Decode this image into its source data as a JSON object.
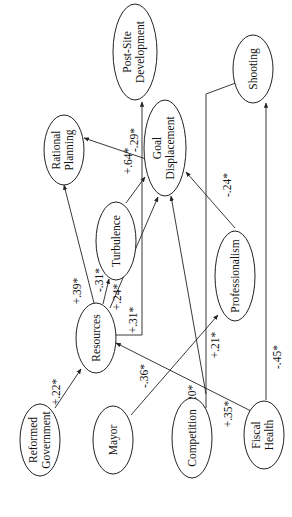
{
  "diagram": {
    "type": "path-diagram",
    "orientation": "rotated-90-ccw",
    "nodes": {
      "reformed_government": {
        "line1": "Reformed",
        "line2": "Government"
      },
      "mayor": {
        "line1": "Mayor"
      },
      "competition": {
        "line1": "Competition"
      },
      "fiscal_health": {
        "line1": "Fiscal",
        "line2": "Health"
      },
      "resources": {
        "line1": "Resources"
      },
      "turbulence": {
        "line1": "Turbulence"
      },
      "professionalism": {
        "line1": "Professionalism"
      },
      "rational_planning": {
        "line1": "Rational",
        "line2": "Planning"
      },
      "goal_displacement": {
        "line1": "Goal",
        "line2": "Displacement"
      },
      "post_site_development": {
        "line1": "Post-Site",
        "line2": "Development"
      },
      "shooting": {
        "line1": "Shooting"
      }
    },
    "edges": [
      {
        "from": "Reformed Government",
        "to": "Resources",
        "label": "+.22*"
      },
      {
        "from": "Mayor",
        "to": "Professionalism",
        "label": "-.36*"
      },
      {
        "from": "Competition",
        "to": "Goal Displacement",
        "label": "+.20*"
      },
      {
        "from": "Fiscal Health",
        "to": "Resources",
        "label": "+.35*"
      },
      {
        "from": "Fiscal Health",
        "to": "Shooting",
        "label": "-.45*"
      },
      {
        "from": "Resources",
        "to": "Rational Planning",
        "label": "+.39*"
      },
      {
        "from": "Resources",
        "to": "Turbulence",
        "label": "-.31*"
      },
      {
        "from": "Resources",
        "to": "Goal Displacement",
        "label": "+.24*"
      },
      {
        "from": "Resources",
        "to": "Post-Site Development",
        "label": "+.31*"
      },
      {
        "from": "Turbulence",
        "to": "Goal Displacement",
        "label": "+.64*"
      },
      {
        "from": "Goal Displacement",
        "to": "Rational Planning",
        "label": "-.29*"
      },
      {
        "from": "Professionalism",
        "to": "Goal Displacement",
        "label": "-.24*"
      },
      {
        "from": "Competition",
        "to": "Shooting",
        "label": "+.21*"
      }
    ],
    "labels": {
      "reformed_resources": "+.22*",
      "mayor_prof": "-.36*",
      "comp_goal": "+.20*",
      "fiscal_resources": "+.35*",
      "fiscal_shooting": "-.45*",
      "res_rational": "+.39*",
      "res_turb": "-.31*",
      "res_goal": "+.24*",
      "res_postsite": "+.31*",
      "turb_goal": "+.64*",
      "goal_rational": "-.29*",
      "prof_goal": "-.24*",
      "comp_shooting": "+.21*"
    }
  }
}
